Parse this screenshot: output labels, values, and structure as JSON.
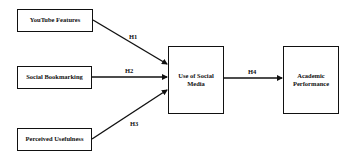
{
  "diagram": {
    "type": "research-model",
    "nodes": [
      {
        "id": "youtube",
        "label": "YouTube Features"
      },
      {
        "id": "bookmarking",
        "label": "Social Bookmarking"
      },
      {
        "id": "usefulness",
        "label": "Perceived Usefulness"
      },
      {
        "id": "social_media",
        "label": "Use of Social Media"
      },
      {
        "id": "academic",
        "label": "Academic Performance"
      }
    ],
    "edges": [
      {
        "from": "youtube",
        "to": "social_media",
        "label": "H1"
      },
      {
        "from": "bookmarking",
        "to": "social_media",
        "label": "H2"
      },
      {
        "from": "usefulness",
        "to": "social_media",
        "label": "H3"
      },
      {
        "from": "social_media",
        "to": "academic",
        "label": "H4"
      }
    ]
  }
}
